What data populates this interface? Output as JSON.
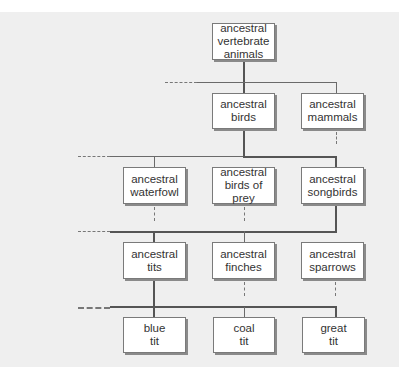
{
  "diagram": {
    "type": "evolutionary-tree",
    "nodes": {
      "vertebrates": "ancestral\nvertebrate\nanimals",
      "birds": "ancestral\nbirds",
      "mammals": "ancestral\nmammals",
      "waterfowl": "ancestral\nwaterfowl",
      "birds_of_prey": "ancestral\nbirds of prey",
      "songbirds": "ancestral\nsongbirds",
      "tits": "ancestral\ntits",
      "finches": "ancestral\nfinches",
      "sparrows": "ancestral\nsparrows",
      "blue_tit": "blue\ntit",
      "coal_tit": "coal\ntit",
      "great_tit": "great\ntit"
    },
    "edges": [
      [
        "vertebrates",
        "birds"
      ],
      [
        "vertebrates",
        "mammals"
      ],
      [
        "birds",
        "waterfowl"
      ],
      [
        "birds",
        "birds_of_prey"
      ],
      [
        "birds",
        "songbirds"
      ],
      [
        "songbirds",
        "tits"
      ],
      [
        "songbirds",
        "finches"
      ],
      [
        "songbirds",
        "sparrows"
      ],
      [
        "tits",
        "blue_tit"
      ],
      [
        "tits",
        "coal_tit"
      ],
      [
        "tits",
        "great_tit"
      ]
    ],
    "colors": {
      "background": "#efefef",
      "box": "#ffffff",
      "line": "#555555"
    }
  }
}
